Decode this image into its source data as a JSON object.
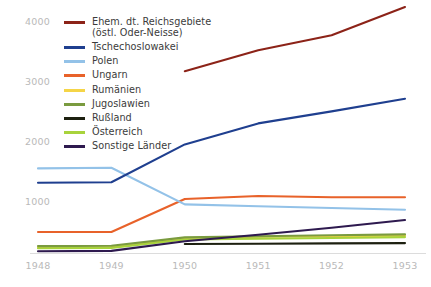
{
  "chart_data": {
    "type": "line",
    "title": "",
    "subtitle": "",
    "xlabel": "",
    "ylabel": "",
    "x": [
      1948,
      1949,
      1950,
      1951,
      1952,
      1953
    ],
    "xticklabels": [
      "1948",
      "1949",
      "1950",
      "1951",
      "1952",
      "1953"
    ],
    "yticklabels": [
      "1000",
      "2000",
      "3000",
      "4000"
    ],
    "yticks": [
      1000,
      2000,
      3000,
      4000
    ],
    "ylim": [
      0,
      4400
    ],
    "xlim": [
      1948,
      1953
    ],
    "grid": false,
    "legend_position": "upper-left-inside",
    "units_note": "Werte in Tausend",
    "series": [
      {
        "name": "Ehem. dt. Reichsgebiete\n(östl. Oder-Neisse)",
        "legend_label_line1": "Ehem. dt. Reichsgebiete",
        "legend_label_line2": "(östl. Oder-Neisse)",
        "color": "#8c2318",
        "x": [
          1950,
          1951,
          1952,
          1953
        ],
        "values": [
          3180,
          3530,
          3780,
          4250
        ]
      },
      {
        "name": "Tschechoslowakei",
        "color": "#1f3f8f",
        "x": [
          1948,
          1949,
          1950,
          1951,
          1952,
          1953
        ],
        "values": [
          1320,
          1330,
          1960,
          2310,
          2510,
          2720
        ]
      },
      {
        "name": "Polen",
        "color": "#93c2e8",
        "x": [
          1948,
          1949,
          1950,
          1951,
          1952,
          1953
        ],
        "values": [
          1560,
          1570,
          960,
          930,
          900,
          870
        ]
      },
      {
        "name": "Ungarn",
        "color": "#e8622a",
        "x": [
          1948,
          1949,
          1950,
          1951,
          1952,
          1953
        ],
        "values": [
          500,
          500,
          1050,
          1100,
          1080,
          1080
        ]
      },
      {
        "name": "Rumänien",
        "color": "#f5d547",
        "x": [
          1948,
          1949,
          1950,
          1951,
          1952,
          1953
        ],
        "values": [
          245,
          250,
          400,
          420,
          430,
          440
        ]
      },
      {
        "name": "Jugoslawien",
        "color": "#7a9b3f",
        "x": [
          1948,
          1949,
          1950,
          1951,
          1952,
          1953
        ],
        "values": [
          265,
          270,
          410,
          430,
          445,
          460
        ]
      },
      {
        "name": "Rußland",
        "color": "#1d2010",
        "x": [
          1950,
          1951,
          1952,
          1953
        ],
        "values": [
          300,
          305,
          310,
          315
        ]
      },
      {
        "name": "Österreich",
        "color": "#a8d33c",
        "x": [
          1948,
          1949,
          1950,
          1951,
          1952,
          1953
        ],
        "values": [
          230,
          235,
          375,
          390,
          400,
          415
        ]
      },
      {
        "name": "Sonstige Länder",
        "color": "#2e1a4f",
        "x": [
          1948,
          1949,
          1950,
          1951,
          1952,
          1953
        ],
        "values": [
          180,
          185,
          345,
          455,
          570,
          700
        ]
      }
    ]
  },
  "axes": {
    "yticks": [
      {
        "label": "4000",
        "value": 4000
      },
      {
        "label": "3000",
        "value": 3000
      },
      {
        "label": "2000",
        "value": 2000
      },
      {
        "label": "1000",
        "value": 1000
      }
    ],
    "xticks": [
      {
        "label": "1948"
      },
      {
        "label": "1949"
      },
      {
        "label": "1950"
      },
      {
        "label": "1951"
      },
      {
        "label": "1952"
      },
      {
        "label": "1953"
      }
    ]
  },
  "legend": {
    "items": [
      {
        "label": "Ehem. dt. Reichsgebiete\n(östl. Oder-Neisse)",
        "color": "#8c2318",
        "tall": true
      },
      {
        "label": "Tschechoslowakei",
        "color": "#1f3f8f",
        "tall": false
      },
      {
        "label": "Polen",
        "color": "#93c2e8",
        "tall": false
      },
      {
        "label": "Ungarn",
        "color": "#e8622a",
        "tall": false
      },
      {
        "label": "Rumänien",
        "color": "#f5d547",
        "tall": false
      },
      {
        "label": "Jugoslawien",
        "color": "#7a9b3f",
        "tall": false
      },
      {
        "label": "Rußland",
        "color": "#1d2010",
        "tall": false
      },
      {
        "label": "Österreich",
        "color": "#a8d33c",
        "tall": false
      },
      {
        "label": "Sonstige Länder",
        "color": "#2e1a4f",
        "tall": false
      }
    ]
  },
  "colors": {
    "tick_text": "#b9b9b9",
    "legend_text": "#3b3b3b",
    "axis_line": "#dcdcdc",
    "background": "#ffffff"
  }
}
